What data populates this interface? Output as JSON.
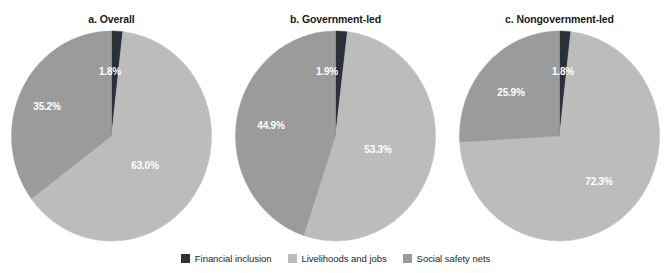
{
  "chart_data": [
    {
      "type": "pie",
      "title": "a. Overall",
      "panel_key": "a",
      "categories": [
        "Financial inclusion",
        "Livelihoods and jobs",
        "Social safety nets"
      ],
      "values": [
        1.8,
        63.0,
        35.2
      ],
      "labels": [
        "1.8%",
        "63.0%",
        "35.2%"
      ],
      "colors": [
        "#2b3039",
        "#bcbcbc",
        "#9b9b9b"
      ],
      "legend_position": "bottom",
      "grid": false
    },
    {
      "type": "pie",
      "title": "b. Government-led",
      "panel_key": "b",
      "categories": [
        "Financial inclusion",
        "Livelihoods and jobs",
        "Social safety nets"
      ],
      "values": [
        1.9,
        53.3,
        44.9
      ],
      "labels": [
        "1.9%",
        "53.3%",
        "44.9%"
      ],
      "colors": [
        "#2b3039",
        "#bcbcbc",
        "#9b9b9b"
      ],
      "legend_position": "bottom",
      "grid": false
    },
    {
      "type": "pie",
      "title": "c. Nongovernment-led",
      "panel_key": "c",
      "categories": [
        "Financial inclusion",
        "Livelihoods and jobs",
        "Social safety nets"
      ],
      "values": [
        1.8,
        72.3,
        25.9
      ],
      "labels": [
        "1.8%",
        "72.3%",
        "25.9%"
      ],
      "colors": [
        "#2b3039",
        "#bcbcbc",
        "#9b9b9b"
      ],
      "legend_position": "bottom",
      "grid": false
    }
  ],
  "panels": [
    {
      "title": "a. Overall",
      "slices": [
        {
          "name": "Financial inclusion",
          "value": 1.8,
          "label": "1.8%",
          "color": "#2b3039",
          "label_x": 101,
          "label_y": 42
        },
        {
          "name": "Livelihoods and jobs",
          "value": 63.0,
          "label": "63.0%",
          "color": "#bcbcbc",
          "label_x": 136,
          "label_y": 136
        },
        {
          "name": "Social safety nets",
          "value": 35.2,
          "label": "35.2%",
          "color": "#9b9b9b",
          "label_x": 38,
          "label_y": 77
        }
      ]
    },
    {
      "title": "b. Government-led",
      "slices": [
        {
          "name": "Financial inclusion",
          "value": 1.9,
          "label": "1.9%",
          "color": "#2b3039",
          "label_x": 94,
          "label_y": 42
        },
        {
          "name": "Livelihoods and jobs",
          "value": 53.3,
          "label": "53.3%",
          "color": "#bcbcbc",
          "label_x": 145,
          "label_y": 120
        },
        {
          "name": "Social safety nets",
          "value": 44.9,
          "label": "44.9%",
          "color": "#9b9b9b",
          "label_x": 38,
          "label_y": 96
        }
      ]
    },
    {
      "title": "c. Nongovernment-led",
      "slices": [
        {
          "name": "Financial inclusion",
          "value": 1.8,
          "label": "1.8%",
          "color": "#2b3039",
          "label_x": 106,
          "label_y": 42
        },
        {
          "name": "Livelihoods and jobs",
          "value": 72.3,
          "label": "72.3%",
          "color": "#bcbcbc",
          "label_x": 142,
          "label_y": 152
        },
        {
          "name": "Social safety nets",
          "value": 25.9,
          "label": "25.9%",
          "color": "#9b9b9b",
          "label_x": 54,
          "label_y": 63
        }
      ]
    }
  ],
  "legend": {
    "items": [
      {
        "label": "Financial inclusion",
        "color": "#2b3039"
      },
      {
        "label": "Livelihoods and jobs",
        "color": "#bcbcbc"
      },
      {
        "label": "Social safety nets",
        "color": "#9b9b9b"
      }
    ]
  }
}
